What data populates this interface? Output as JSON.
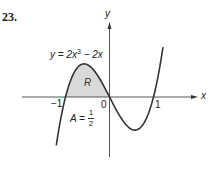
{
  "problem_number": "23.",
  "axes": {
    "x_label": "x",
    "y_label": "y"
  },
  "equation": "y = 2x³ − 2x",
  "region_label": "R",
  "area": {
    "prefix": "A =",
    "numerator": "1",
    "denominator": "2"
  },
  "ticks": {
    "neg_one": "−1",
    "zero": "0",
    "one": "1"
  },
  "colors": {
    "curve": "#333333",
    "axes": "#444444",
    "fill": "#d9d9d9"
  },
  "chart_data": {
    "type": "line",
    "title": "",
    "function": "y = 2x^3 - 2x",
    "xlabel": "x",
    "ylabel": "y",
    "x_ticks": [
      -1,
      0,
      1
    ],
    "xlim": [
      -1.21,
      1.215
    ],
    "series": [
      {
        "name": "y = 2x^3 - 2x",
        "x": [
          -1.21,
          -1.0,
          -0.8,
          -0.577,
          -0.4,
          -0.2,
          0,
          0.2,
          0.4,
          0.577,
          0.8,
          1.0,
          1.215
        ],
        "values": [
          -1.123,
          0,
          0.576,
          0.77,
          0.672,
          0.384,
          0,
          -0.384,
          -0.672,
          -0.77,
          -0.576,
          0,
          1.157
        ]
      }
    ],
    "shaded_region": {
      "label": "R",
      "x_from": -1,
      "x_to": 0,
      "area": 0.5,
      "area_label": "A = 1/2"
    },
    "grid": false,
    "legend": null
  }
}
